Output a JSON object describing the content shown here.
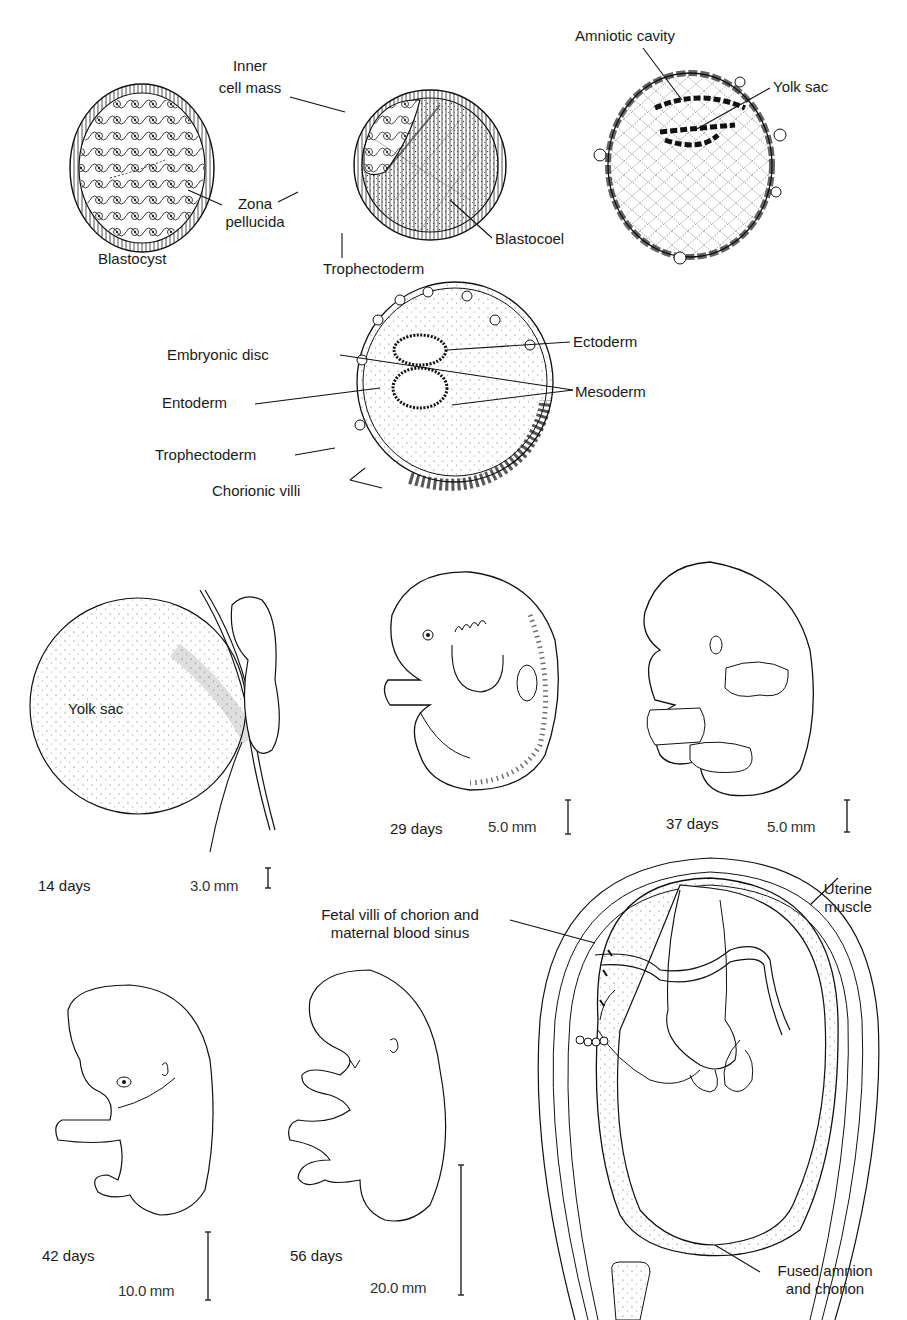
{
  "figure": {
    "panels": {
      "blastocyst": {
        "caption": "Blastocyst",
        "labels": {
          "zona_pellucida_1": "Zona",
          "zona_pellucida_2": "pellucida"
        }
      },
      "implanting_blastocyst": {
        "labels": {
          "inner_cell_mass_1": "Inner",
          "inner_cell_mass_2": "cell mass",
          "blastocoel": "Blastocoel",
          "trophectoderm": "Trophectoderm"
        }
      },
      "bilaminar": {
        "labels": {
          "amniotic_cavity": "Amniotic cavity",
          "yolk_sac": "Yolk sac"
        }
      },
      "germ_layers": {
        "labels": {
          "ectoderm": "Ectoderm",
          "embryonic_disc": "Embryonic disc",
          "mesoderm": "Mesoderm",
          "entoderm": "Entoderm",
          "trophectoderm": "Trophectoderm",
          "chorionic_villi": "Chorionic villi"
        }
      },
      "day14": {
        "inner_label": "Yolk sac",
        "age": "14 days",
        "scale": "3.0 mm"
      },
      "day29": {
        "age": "29 days",
        "scale": "5.0 mm"
      },
      "day37": {
        "age": "37 days",
        "scale": "5.0 mm"
      },
      "day42": {
        "age": "42 days",
        "scale": "10.0 mm"
      },
      "day56": {
        "age": "56 days",
        "scale": "20.0 mm"
      },
      "fetus_in_uterus": {
        "labels": {
          "uterine_muscle_1": "Uterine",
          "uterine_muscle_2": "muscle",
          "fetal_villi_1": "Fetal villi of chorion and",
          "fetal_villi_2": "maternal blood sinus",
          "fused_1": "Fused amnion",
          "fused_2": "and chorion"
        }
      }
    }
  }
}
